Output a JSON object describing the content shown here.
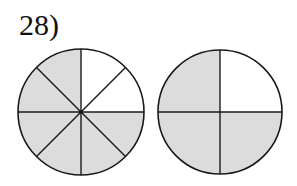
{
  "problem": {
    "number_label": "28)"
  },
  "colors": {
    "shaded": "#dcdcdc",
    "unshaded": "#ffffff",
    "stroke": "#1a1a1a"
  },
  "figures": [
    {
      "name": "left-circle",
      "divisions": 8,
      "shaded_parts": 6,
      "unshaded_slices": [
        "top-right-upper",
        "top-right-lower"
      ],
      "center": [
        81,
        112
      ],
      "radius": 63
    },
    {
      "name": "right-circle",
      "divisions": 4,
      "shaded_parts": 3,
      "unshaded_slices": [
        "top-right"
      ],
      "center": [
        220,
        112
      ],
      "radius": 62
    }
  ]
}
